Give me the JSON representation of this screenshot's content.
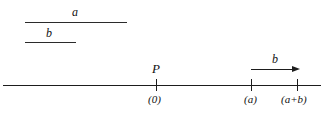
{
  "figure": {
    "type": "number-line-diagram",
    "width": 327,
    "height": 113,
    "background_color": "#ffffff",
    "ink_color": "#1d1d1d"
  },
  "segments": [
    {
      "name": "segment-a",
      "label": "a",
      "x_start": 25,
      "x_end": 127,
      "y": 22,
      "length_px": 102,
      "label_x": 76,
      "label_y": 6
    },
    {
      "name": "segment-b",
      "label": "b",
      "x_start": 25,
      "x_end": 76,
      "y": 42,
      "length_px": 51,
      "label_x": 50,
      "label_y": 27
    }
  ],
  "number_line": {
    "name": "number-line",
    "x_start": 3,
    "x_end": 321,
    "y": 85,
    "ticks": [
      {
        "name": "tick-zero",
        "label": "(0)",
        "x": 156,
        "point_label": "P"
      },
      {
        "name": "tick-a",
        "label": "(a)",
        "x": 251,
        "point_label": ""
      },
      {
        "name": "tick-a-plus-b",
        "label": "(a+b)",
        "x": 297,
        "point_label": ""
      }
    ]
  },
  "vector": {
    "name": "vector-b",
    "label": "b",
    "x_start": 251,
    "x_end": 300,
    "y": 69,
    "label_x": 275,
    "label_y": 54,
    "direction": "right"
  }
}
